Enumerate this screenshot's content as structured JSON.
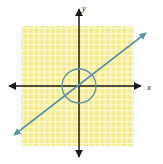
{
  "figure": {
    "name": "coordinate-plane-graph",
    "width": 163,
    "height": 164,
    "background_color": "#ffffff"
  },
  "axes": {
    "x_axis_label": "x",
    "y_axis_label": "y",
    "axis_color": "#1a1a1a",
    "origin": {
      "x": 79,
      "y": 86
    },
    "x_axis_extent": {
      "left": 8,
      "right": 142
    },
    "y_axis_extent": {
      "top": 8,
      "bottom": 158
    },
    "arrowheads": [
      "left",
      "right",
      "up",
      "down"
    ]
  },
  "shaded_region": {
    "name": "solution-region",
    "description": "square shaded region",
    "fill_color": "#f6ee9e",
    "grid_line_color": "#ffffff",
    "grid_spacing": 5.5,
    "bounds": {
      "left": 21,
      "top": 26,
      "right": 134,
      "bottom": 146
    }
  },
  "circle": {
    "name": "circle-curve",
    "stroke_color": "#5d93a5",
    "center": {
      "x": 79,
      "y": 86
    },
    "radius": 17
  },
  "line": {
    "name": "diagonal-line",
    "stroke_color": "#5d93a5",
    "start": {
      "x": 12,
      "y": 137
    },
    "end": {
      "x": 148,
      "y": 31
    },
    "slope_description": "positive slope through origin",
    "arrowheads": [
      "start",
      "end"
    ]
  }
}
